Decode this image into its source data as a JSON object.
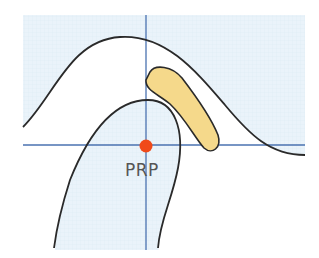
{
  "diagram": {
    "point_label": "PRP",
    "colors": {
      "background": "#ffffff",
      "grid_fill": "#eaf3fa",
      "grid_line": "#dde9f3",
      "axis_line": "#4a72b0",
      "outline": "#2a2a2a",
      "highlight_fill": "#f5d98b",
      "point": "#f04a1a",
      "label": "#555555"
    },
    "point": {
      "x": 146,
      "y": 146
    },
    "axes": {
      "horizontal": {
        "x1": 23,
        "x2": 305,
        "y": 145
      },
      "vertical": {
        "x": 146,
        "y1": 15,
        "y2": 250
      }
    }
  }
}
